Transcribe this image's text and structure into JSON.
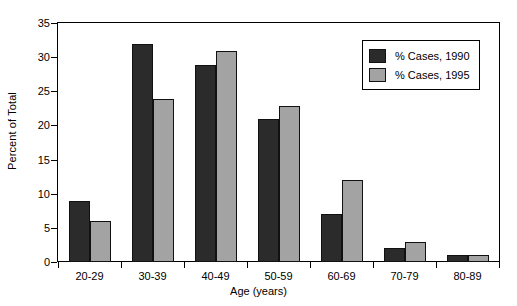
{
  "chart_data": {
    "type": "bar",
    "title": "",
    "xlabel": "Age (years)",
    "ylabel": "Percent of Total",
    "categories": [
      "20-29",
      "30-39",
      "40-49",
      "50-59",
      "60-69",
      "70-79",
      "80-89"
    ],
    "series": [
      {
        "name": "% Cases, 1990",
        "color": "#2b2b2b",
        "values": [
          9,
          32,
          29,
          21,
          7,
          2,
          1
        ]
      },
      {
        "name": "% Cases, 1995",
        "color": "#a3a3a3",
        "values": [
          6,
          24,
          31,
          23,
          12,
          3,
          1
        ]
      }
    ],
    "ylim": [
      0,
      35
    ],
    "ytick_labels": [
      "0",
      "5",
      "10",
      "15",
      "20",
      "25",
      "30",
      "35"
    ],
    "ytick_values": [
      0,
      5,
      10,
      15,
      20,
      25,
      30,
      35
    ],
    "grid": false,
    "legend_position": "top-right"
  }
}
